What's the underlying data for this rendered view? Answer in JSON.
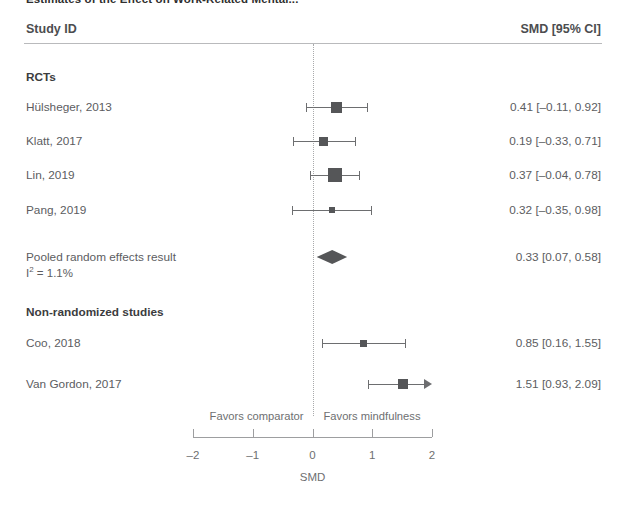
{
  "chart_title": "Estimates of the Effect on Work-Related Mental...",
  "header": {
    "study_id_label": "Study ID",
    "smd_ci_label": "SMD [95% CI]"
  },
  "axis": {
    "name": "SMD",
    "tick_labels": [
      "–2",
      "–1",
      "0",
      "1",
      "2"
    ],
    "tick_values": [
      -2,
      -1,
      0,
      1,
      2
    ],
    "favors_left": "Favors comparator",
    "favors_right": "Favors mindfulness",
    "xlim": [
      -2,
      2
    ]
  },
  "groups": [
    {
      "label": "RCTs"
    },
    {
      "label": "Non-randomized studies"
    }
  ],
  "rows": [
    {
      "kind": "group",
      "label": "RCTs",
      "value": "",
      "y": 70
    },
    {
      "kind": "study",
      "label": "Hülsheger, 2013",
      "value": "0.41 [–0.11, 0.92]",
      "estimate": 0.41,
      "ci_low": -0.11,
      "ci_high": 0.92,
      "marker_size": 11,
      "y": 100
    },
    {
      "kind": "study",
      "label": "Klatt, 2017",
      "value": "0.19 [–0.33, 0.71]",
      "estimate": 0.19,
      "ci_low": -0.33,
      "ci_high": 0.71,
      "marker_size": 9,
      "y": 134
    },
    {
      "kind": "study",
      "label": "Lin, 2019",
      "value": "0.37 [–0.04, 0.78]",
      "estimate": 0.37,
      "ci_low": -0.04,
      "ci_high": 0.78,
      "marker_size": 14,
      "y": 168
    },
    {
      "kind": "study",
      "label": "Pang, 2019",
      "value": "0.32 [–0.35, 0.98]",
      "estimate": 0.32,
      "ci_low": -0.35,
      "ci_high": 0.98,
      "marker_size": 6,
      "y": 203
    },
    {
      "kind": "pooled",
      "label": "Pooled random effects result",
      "sublabel_prefix": "I",
      "sublabel_sup": "2",
      "sublabel_suffix": " = 1.1%",
      "sublabel_full": "I² = 1.1%",
      "value": "0.33 [0.07, 0.58]",
      "estimate": 0.33,
      "ci_low": 0.07,
      "ci_high": 0.58,
      "diamond_half_height": 7,
      "y": 250
    },
    {
      "kind": "group",
      "label": "Non-randomized studies",
      "value": "",
      "y": 305
    },
    {
      "kind": "study",
      "label": "Coo, 2018",
      "value": "0.85 [0.16, 1.55]",
      "estimate": 0.85,
      "ci_low": 0.16,
      "ci_high": 1.55,
      "marker_size": 7,
      "y": 336
    },
    {
      "kind": "study",
      "label": "Van Gordon, 2017",
      "value": "1.51 [0.93, 2.09]",
      "estimate": 1.51,
      "ci_low": 0.93,
      "ci_high": 2.09,
      "marker_size": 10,
      "clipped_right": true,
      "y": 377
    }
  ],
  "chart_data": {
    "type": "scatter",
    "title": "Estimates of the Effect on Work-Related Mental...",
    "xlabel": "SMD",
    "ylabel": "",
    "xlim": [
      -2,
      2
    ],
    "xticks": [
      -2,
      -1,
      0,
      1,
      2
    ],
    "grid": false,
    "legend_position": "none",
    "reference_line": 0,
    "annotations": [
      "Favors comparator",
      "Favors mindfulness",
      "I² = 1.1%"
    ],
    "subgroups": [
      {
        "name": "RCTs",
        "studies": [
          {
            "label": "Hülsheger, 2013",
            "estimate": 0.41,
            "ci_low": -0.11,
            "ci_high": 0.92
          },
          {
            "label": "Klatt, 2017",
            "estimate": 0.19,
            "ci_low": -0.33,
            "ci_high": 0.71
          },
          {
            "label": "Lin, 2019",
            "estimate": 0.37,
            "ci_low": -0.04,
            "ci_high": 0.78
          },
          {
            "label": "Pang, 2019",
            "estimate": 0.32,
            "ci_low": -0.35,
            "ci_high": 0.98
          }
        ],
        "pooled": {
          "label": "Pooled random effects result",
          "estimate": 0.33,
          "ci_low": 0.07,
          "ci_high": 0.58,
          "i_squared": "1.1%"
        }
      },
      {
        "name": "Non-randomized studies",
        "studies": [
          {
            "label": "Coo, 2018",
            "estimate": 0.85,
            "ci_low": 0.16,
            "ci_high": 1.55
          },
          {
            "label": "Van Gordon, 2017",
            "estimate": 1.51,
            "ci_low": 0.93,
            "ci_high": 2.09,
            "ci_high_clipped": true
          }
        ],
        "pooled": null
      }
    ]
  },
  "colors": {
    "marker": "#555658",
    "line": "#6d6e70",
    "axis": "#9d9ea0",
    "text": "#5c5d5f",
    "rule": "#b9babc",
    "zero_line": "#a9aaac"
  },
  "geometry": {
    "axis_left_px": 193,
    "axis_right_px": 432,
    "px_per_unit": 59.75,
    "zero_px": 312.5,
    "axis_y_px": 437
  }
}
